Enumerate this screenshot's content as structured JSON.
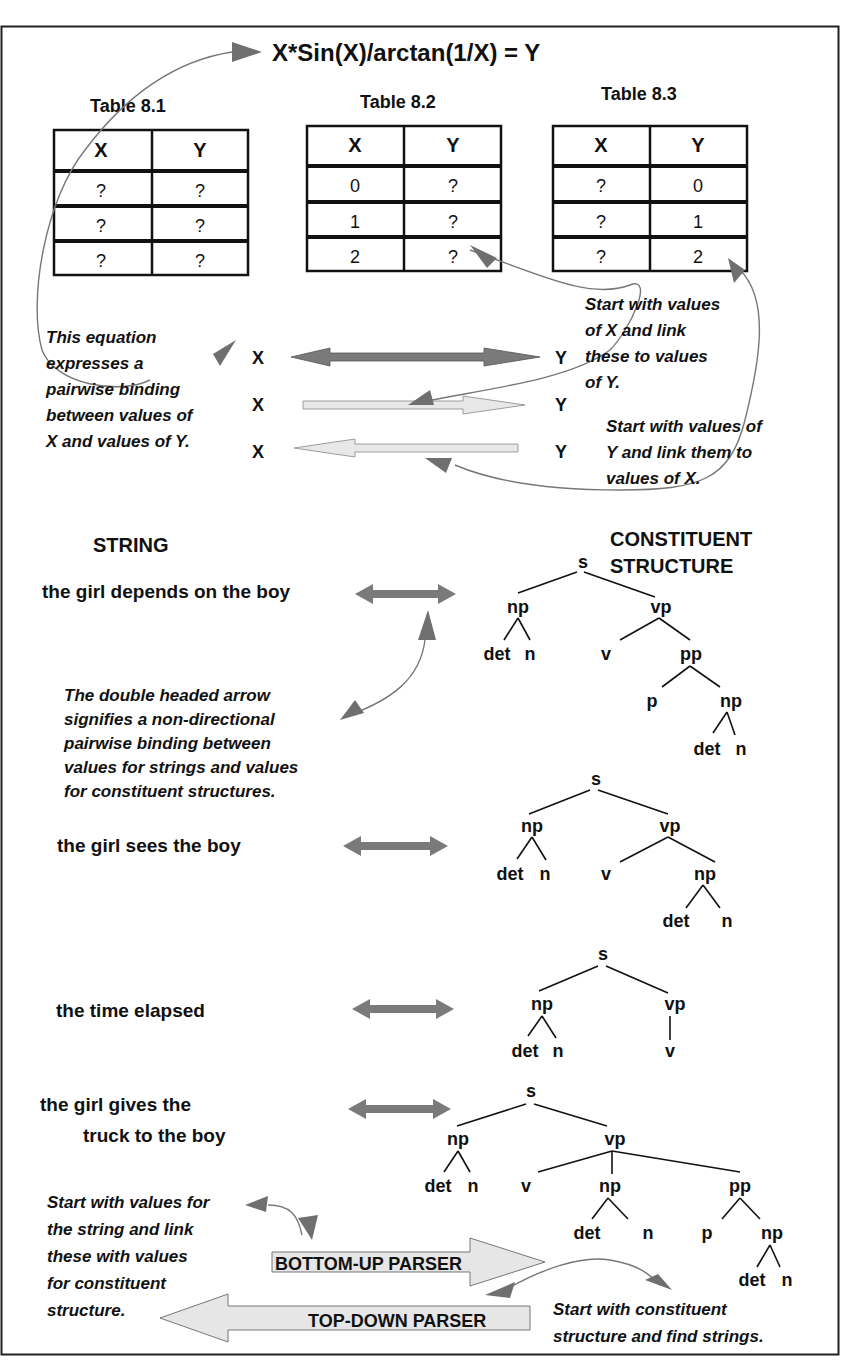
{
  "equation": "X*Sin(X)/arctan(1/X) = Y",
  "tables": [
    {
      "title": "Table 8.1",
      "headers": [
        "X",
        "Y"
      ],
      "rows": [
        [
          "?",
          "?"
        ],
        [
          "?",
          "?"
        ],
        [
          "?",
          "?"
        ]
      ]
    },
    {
      "title": "Table 8.2",
      "headers": [
        "X",
        "Y"
      ],
      "rows": [
        [
          "0",
          "?"
        ],
        [
          "1",
          "?"
        ],
        [
          "2",
          "?"
        ]
      ]
    },
    {
      "title": "Table 8.3",
      "headers": [
        "X",
        "Y"
      ],
      "rows": [
        [
          "?",
          "0"
        ],
        [
          "?",
          "1"
        ],
        [
          "?",
          "2"
        ]
      ]
    }
  ],
  "binding": {
    "x_label": "X",
    "y_label": "Y",
    "note_left": [
      "This equation",
      "expresses a",
      "pairwise binding",
      "between values of",
      "X and values of Y."
    ],
    "note_right_top": [
      "Start with values",
      "of X and link",
      "these to values",
      "of Y."
    ],
    "note_right_bottom": [
      "Start with values of",
      "Y and link them to",
      "values of X."
    ]
  },
  "headings": {
    "string": "STRING",
    "constituent": [
      "CONSTITUENT",
      "STRUCTURE"
    ]
  },
  "sentences": [
    {
      "text": [
        "the girl depends on the boy"
      ]
    },
    {
      "text": [
        "the girl sees the boy"
      ]
    },
    {
      "text": [
        "the time elapsed"
      ]
    },
    {
      "text": [
        "the girl gives the",
        "truck to the boy"
      ]
    }
  ],
  "note_double_arrow": [
    "The double headed arrow",
    "signifies a non-directional",
    "pairwise binding between",
    "values for strings and values",
    "for constituent structures."
  ],
  "trees": {
    "labels": {
      "s": "s",
      "np": "np",
      "vp": "vp",
      "pp": "pp",
      "det": "det",
      "n": "n",
      "v": "v",
      "p": "p"
    }
  },
  "parsers": {
    "bottom_up": "BOTTOM-UP PARSER",
    "top_down": "TOP-DOWN PARSER",
    "note_bottom_up": [
      "Start with values for",
      "the string and link",
      "these with values",
      "for constituent",
      "structure."
    ],
    "note_top_down": [
      "Start with constituent",
      "structure and find strings."
    ]
  },
  "colors": {
    "arrow_dark": "#7a7a7a",
    "arrow_light": "#e6e6e6",
    "border": "#222222"
  }
}
